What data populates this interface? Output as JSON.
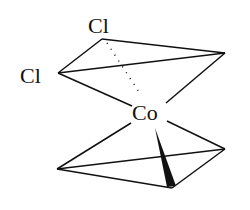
{
  "diagram": {
    "type": "molecular-structure",
    "atoms": {
      "cl_top": "Cl",
      "cl_left": "Cl",
      "center": "Co"
    },
    "colors": {
      "stroke": "#111111",
      "background": "#ffffff"
    }
  }
}
